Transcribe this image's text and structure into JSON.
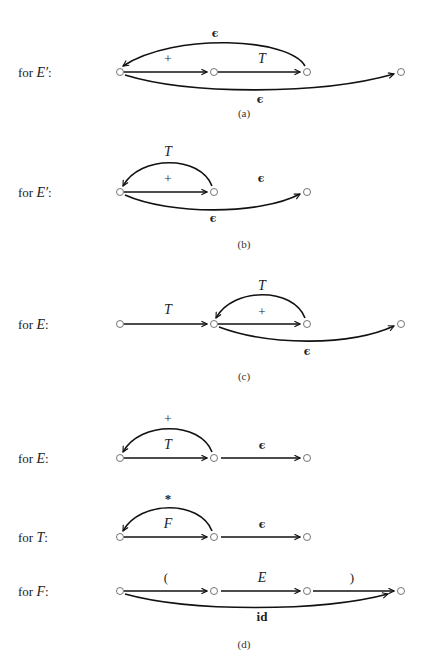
{
  "figure": {
    "colors": {
      "ink": "#111111",
      "node_stroke": "#666666",
      "background": "#ffffff"
    },
    "panels": [
      {
        "id": "a",
        "caption": "(a)",
        "rows": [
          {
            "label_prefix": "for ",
            "nonterminal": "E′",
            "label_suffix": ":",
            "nodes": 4,
            "edges": [
              {
                "from": 0,
                "to": 1,
                "label": "+",
                "kind": "straight"
              },
              {
                "from": 1,
                "to": 2,
                "label": "T",
                "kind": "straight"
              },
              {
                "from": 2,
                "to": 0,
                "label": "ϵ",
                "kind": "arc-back-above"
              },
              {
                "from": 0,
                "to": 3,
                "label": "ϵ",
                "kind": "arc-below"
              }
            ]
          }
        ]
      },
      {
        "id": "b",
        "caption": "(b)",
        "rows": [
          {
            "label_prefix": "for ",
            "nonterminal": "E′",
            "label_suffix": ":",
            "nodes": 3,
            "edges": [
              {
                "from": 0,
                "to": 1,
                "label": "+",
                "kind": "straight"
              },
              {
                "from": 1,
                "to": 0,
                "label": "T",
                "kind": "arc-back-above"
              },
              {
                "from": 0,
                "to": 2,
                "label": "ϵ",
                "kind": "arc-below"
              }
            ],
            "stray_label": "ϵ"
          }
        ]
      },
      {
        "id": "c",
        "caption": "(c)",
        "rows": [
          {
            "label_prefix": "for ",
            "nonterminal": "E",
            "label_suffix": ":",
            "nodes": 4,
            "edges": [
              {
                "from": 0,
                "to": 1,
                "label": "T",
                "kind": "straight"
              },
              {
                "from": 1,
                "to": 2,
                "label": "+",
                "kind": "straight"
              },
              {
                "from": 2,
                "to": 1,
                "label": "T",
                "kind": "arc-back-above"
              },
              {
                "from": 1,
                "to": 3,
                "label": "ϵ",
                "kind": "arc-below"
              }
            ]
          }
        ]
      },
      {
        "id": "d",
        "caption": "(d)",
        "rows": [
          {
            "label_prefix": "for ",
            "nonterminal": "E",
            "label_suffix": ":",
            "nodes": 3,
            "edges": [
              {
                "from": 0,
                "to": 1,
                "label": "T",
                "kind": "straight"
              },
              {
                "from": 1,
                "to": 0,
                "label": "+",
                "kind": "arc-back-above"
              },
              {
                "from": 1,
                "to": 2,
                "label": "ϵ",
                "kind": "straight"
              }
            ]
          },
          {
            "label_prefix": "for ",
            "nonterminal": "T",
            "label_suffix": ":",
            "nodes": 3,
            "edges": [
              {
                "from": 0,
                "to": 1,
                "label": "F",
                "kind": "straight"
              },
              {
                "from": 1,
                "to": 0,
                "label": "*",
                "kind": "arc-back-above"
              },
              {
                "from": 1,
                "to": 2,
                "label": "ϵ",
                "kind": "straight"
              }
            ]
          },
          {
            "label_prefix": "for ",
            "nonterminal": "F",
            "label_suffix": ":",
            "nodes": 4,
            "edges": [
              {
                "from": 0,
                "to": 1,
                "label": "(",
                "kind": "straight"
              },
              {
                "from": 1,
                "to": 2,
                "label": "E",
                "kind": "straight"
              },
              {
                "from": 2,
                "to": 3,
                "label": ")",
                "kind": "straight"
              },
              {
                "from": 0,
                "to": 3,
                "label": "id",
                "kind": "arc-below"
              }
            ]
          }
        ]
      }
    ]
  }
}
